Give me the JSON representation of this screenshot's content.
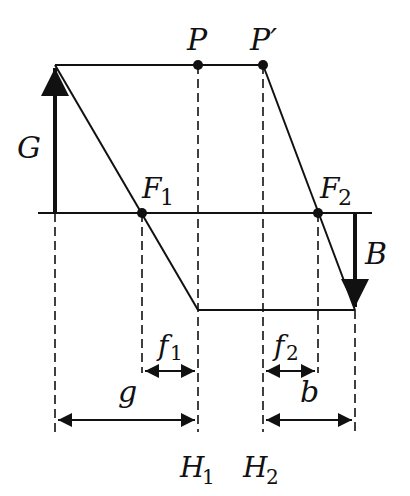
{
  "diagram": {
    "labels": {
      "P": "P",
      "P_prime": "P′",
      "G": "G",
      "B": "B",
      "F1": "F",
      "F1_sub": "1",
      "F2": "F",
      "F2_sub": "2",
      "f1": "f",
      "f1_sub": "1",
      "f2": "f",
      "f2_sub": "2",
      "g": "g",
      "b": "b",
      "H1": "H",
      "H1_sub": "1",
      "H2": "H",
      "H2_sub": "2"
    },
    "colors": {
      "stroke": "#111111",
      "background": "#ffffff"
    }
  }
}
